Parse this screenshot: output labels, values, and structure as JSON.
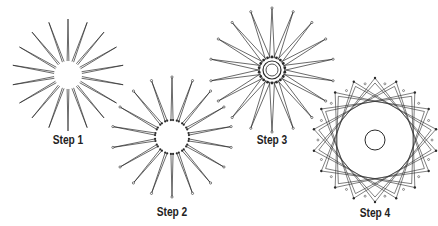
{
  "diagram": {
    "line_color": "#2a2a2a",
    "background": "#ffffff",
    "spoke_count": 18,
    "steps": [
      {
        "label": "Step 1",
        "cx": 68,
        "cy": 75,
        "outer_r": 56,
        "inner_r": 14,
        "mode": "needles",
        "label_x": 68,
        "label_y": 133
      },
      {
        "label": "Step 2",
        "cx": 172,
        "cy": 137,
        "outer_r": 60,
        "inner_r": 17,
        "mode": "pinned",
        "label_x": 172,
        "label_y": 205
      },
      {
        "label": "Step 3",
        "cx": 272,
        "cy": 70,
        "outer_r": 62,
        "inner_r": 9,
        "mode": "dense",
        "label_x": 272,
        "label_y": 133
      },
      {
        "label": "Step 4",
        "cx": 375,
        "cy": 140,
        "outer_r": 62,
        "inner_r": 10,
        "mode": "woven",
        "label_x": 375,
        "label_y": 206
      }
    ]
  }
}
